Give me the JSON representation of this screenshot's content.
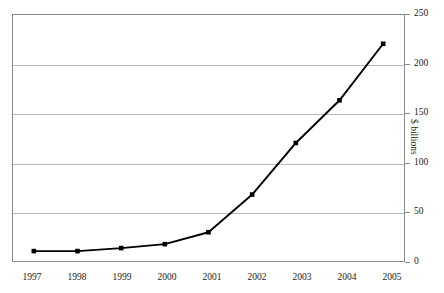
{
  "chart_data": {
    "type": "line",
    "title": "",
    "subtitle": "",
    "xlabel": "",
    "ylabel": "$ billions",
    "categories": [
      "1997",
      "1998",
      "1999",
      "2000",
      "2001",
      "2002",
      "2003",
      "2004",
      "2005"
    ],
    "x": [
      1997,
      1998,
      1999,
      2000,
      2001,
      2002,
      2003,
      2004,
      2005
    ],
    "values": [
      11,
      11,
      14,
      18,
      30,
      68,
      120,
      163,
      220
    ],
    "series": [
      {
        "name": "",
        "values": [
          11,
          11,
          14,
          18,
          30,
          68,
          120,
          163,
          220
        ]
      }
    ],
    "ylim": [
      0,
      250
    ],
    "yticks": [
      0,
      50,
      100,
      150,
      200,
      250
    ],
    "ytick_labels": [
      "0",
      "50",
      "100",
      "150",
      "200",
      "250"
    ],
    "y_axis_position": "right",
    "grid": true,
    "grid_axis": "y",
    "legend": false,
    "legend_position": "none",
    "marker": "square",
    "line_color": "#000000",
    "marker_color": "#000000",
    "grid_color": "#b9b9b9",
    "frame_color": "#8a8a8a",
    "background_color": "#ffffff",
    "annotations": []
  },
  "axes": {
    "x_tick_labels": [
      "1997",
      "1998",
      "1999",
      "2000",
      "2001",
      "2002",
      "2003",
      "2004",
      "2005"
    ],
    "y_tick_labels": [
      "250",
      "200",
      "150",
      "100",
      "50",
      "0"
    ],
    "y_title": "$ billions"
  }
}
